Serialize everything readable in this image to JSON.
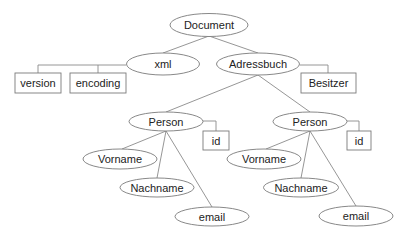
{
  "diagram": {
    "type": "tree",
    "nodes": {
      "document": {
        "label": "Document",
        "shape": "ellipse"
      },
      "xml": {
        "label": "xml",
        "shape": "ellipse"
      },
      "version": {
        "label": "version",
        "shape": "rect"
      },
      "encoding": {
        "label": "encoding",
        "shape": "rect"
      },
      "adressbuch": {
        "label": "Adressbuch",
        "shape": "ellipse"
      },
      "besitzer": {
        "label": "Besitzer",
        "shape": "rect"
      },
      "person1": {
        "label": "Person",
        "shape": "ellipse"
      },
      "person1_id": {
        "label": "id",
        "shape": "rect"
      },
      "person1_vorname": {
        "label": "Vorname",
        "shape": "ellipse"
      },
      "person1_nachname": {
        "label": "Nachname",
        "shape": "ellipse"
      },
      "person1_email": {
        "label": "email",
        "shape": "ellipse"
      },
      "person2": {
        "label": "Person",
        "shape": "ellipse"
      },
      "person2_id": {
        "label": "id",
        "shape": "rect"
      },
      "person2_vorname": {
        "label": "Vorname",
        "shape": "ellipse"
      },
      "person2_nachname": {
        "label": "Nachname",
        "shape": "ellipse"
      },
      "person2_email": {
        "label": "email",
        "shape": "ellipse"
      }
    },
    "edges": [
      [
        "Document",
        "xml"
      ],
      [
        "Document",
        "Adressbuch"
      ],
      [
        "xml",
        "version"
      ],
      [
        "xml",
        "encoding"
      ],
      [
        "Adressbuch",
        "Besitzer"
      ],
      [
        "Adressbuch",
        "Person"
      ],
      [
        "Adressbuch",
        "Person"
      ],
      [
        "Person",
        "id"
      ],
      [
        "Person",
        "Vorname"
      ],
      [
        "Person",
        "Nachname"
      ],
      [
        "Person",
        "email"
      ]
    ],
    "legend": {
      "ellipse": "element",
      "rect": "attribute"
    }
  }
}
